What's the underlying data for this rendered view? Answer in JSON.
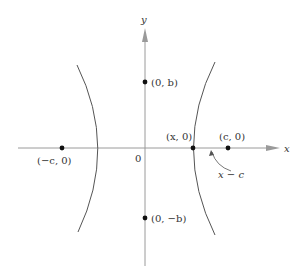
{
  "diagram": {
    "type": "hyperbola",
    "axes": {
      "x_label": "x",
      "y_label": "y",
      "origin_label": "0"
    },
    "points": [
      {
        "id": "neg-focus",
        "label": "(−c, 0)"
      },
      {
        "id": "pos-focus",
        "label": "(c, 0)"
      },
      {
        "id": "vertex-point",
        "label": "(x, 0)"
      },
      {
        "id": "top-point",
        "label": "(0, b)"
      },
      {
        "id": "bottom-point",
        "label": "(0, −b)"
      }
    ],
    "annotation": {
      "label": "x − c"
    },
    "colors": {
      "curve": "#555555",
      "axis": "#9a9a9a",
      "point": "#111111",
      "text": "#333333"
    }
  }
}
